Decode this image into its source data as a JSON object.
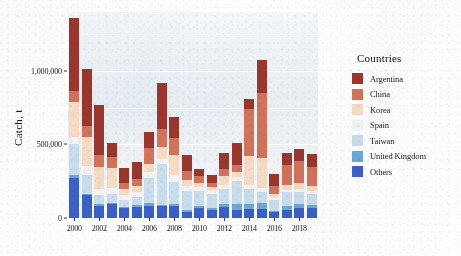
{
  "chart_data": {
    "type": "bar",
    "subtype": "stacked-bar",
    "title": "",
    "xlabel": "",
    "ylabel": "Catch, t",
    "ylim": [
      0,
      1400000
    ],
    "yticks": [
      0,
      500000,
      1000000
    ],
    "ytick_labels": [
      "0",
      "500,000",
      "1,000,000"
    ],
    "grid": true,
    "legend": {
      "title": "Countries",
      "position": "right"
    },
    "categories": [
      "2000",
      "2001",
      "2002",
      "2003",
      "2004",
      "2005",
      "2006",
      "2007",
      "2008",
      "2009",
      "2010",
      "2011",
      "2012",
      "2013",
      "2014",
      "2015",
      "2016",
      "2017",
      "2018",
      "2019"
    ],
    "xtick_labels": [
      "2000",
      "2002",
      "2004",
      "2006",
      "2008",
      "2010",
      "2012",
      "2014",
      "2016",
      "2018"
    ],
    "series": [
      {
        "name": "Others",
        "color": "#3a5fc8",
        "values": [
          270000,
          155000,
          85000,
          95000,
          65000,
          75000,
          80000,
          80000,
          80000,
          40000,
          65000,
          55000,
          75000,
          55000,
          60000,
          60000,
          40000,
          55000,
          70000,
          65000
        ]
      },
      {
        "name": "United Kingdom",
        "color": "#6aa8d8",
        "values": [
          20000,
          10000,
          10000,
          10000,
          10000,
          15000,
          25000,
          10000,
          15000,
          15000,
          20000,
          15000,
          20000,
          40000,
          35000,
          45000,
          10000,
          25000,
          25000,
          25000
        ]
      },
      {
        "name": "Taiwan",
        "color": "#c9dded",
        "values": [
          215000,
          130000,
          60000,
          60000,
          45000,
          55000,
          170000,
          280000,
          150000,
          130000,
          100000,
          95000,
          105000,
          155000,
          105000,
          70000,
          70000,
          95000,
          85000,
          75000
        ]
      },
      {
        "name": "Spain",
        "color": "#f2f3f2",
        "values": [
          45000,
          60000,
          45000,
          40000,
          35000,
          30000,
          35000,
          30000,
          50000,
          30000,
          25000,
          25000,
          25000,
          30000,
          25000,
          30000,
          20000,
          15000,
          20000,
          20000
        ]
      },
      {
        "name": "Korea",
        "color": "#f6dcc4",
        "values": [
          240000,
          195000,
          145000,
          135000,
          45000,
          40000,
          60000,
          85000,
          130000,
          45000,
          30000,
          20000,
          60000,
          35000,
          195000,
          205000,
          20000,
          35000,
          40000,
          35000
        ]
      },
      {
        "name": "China",
        "color": "#d2735a",
        "values": [
          75000,
          75000,
          85000,
          75000,
          35000,
          50000,
          105000,
          120000,
          120000,
          60000,
          45000,
          30000,
          50000,
          45000,
          320000,
          440000,
          55000,
          135000,
          145000,
          130000
        ]
      },
      {
        "name": "Argentina",
        "color": "#9c362d",
        "values": [
          495000,
          385000,
          340000,
          95000,
          105000,
          115000,
          110000,
          310000,
          140000,
          110000,
          50000,
          55000,
          110000,
          150000,
          70000,
          225000,
          85000,
          85000,
          85000,
          85000
        ]
      }
    ],
    "stack_order_bottom_to_top": [
      "Others",
      "United Kingdom",
      "Taiwan",
      "Spain",
      "Korea",
      "China",
      "Argentina"
    ]
  },
  "legend": {
    "title": "Countries",
    "items": [
      {
        "label": "Argentina",
        "color": "#9c362d"
      },
      {
        "label": "China",
        "color": "#d2735a"
      },
      {
        "label": "Korea",
        "color": "#f6dcc4"
      },
      {
        "label": "Spain",
        "color": "#f2f3f2"
      },
      {
        "label": "Taiwan",
        "color": "#c9dded"
      },
      {
        "label": "United Kingdom",
        "color": "#6aa8d8"
      },
      {
        "label": "Others",
        "color": "#3a5fc8"
      }
    ]
  },
  "axes": {
    "y_title": "Catch, t",
    "panel_fill": "#eef2f5"
  }
}
